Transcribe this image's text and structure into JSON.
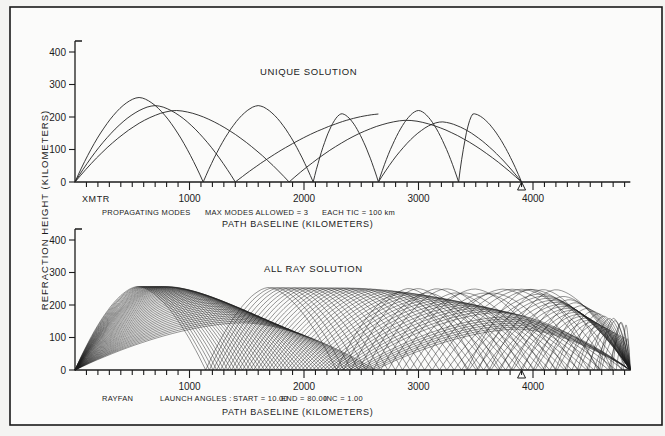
{
  "figure": {
    "y_axis_label": "REFRACTION  HEIGHT (KILOMETERS)",
    "x_axis_label": "PATH  BASELINE  (KILOMETERS)",
    "transmitter_label": "XMTR",
    "receiver_marker": "triangle",
    "receiver_x_km": 3900
  },
  "top_panel": {
    "title": "UNIQUE  SOLUTION",
    "note_left": "PROPAGATING MODES",
    "note_mid": "MAX  MODES  ALLOWED = 3",
    "note_right": "EACH  TIC = 100 km",
    "y_ticks": [
      "0",
      "100",
      "200",
      "300",
      "400"
    ],
    "x_ticks": [
      "1000",
      "2000",
      "3000",
      "4000"
    ]
  },
  "bottom_panel": {
    "title": "ALL  RAY  SOLUTION",
    "note_left": "RAYFAN",
    "note_mid": "LAUNCH  ANGLES :",
    "note_start": "START = 10.00",
    "note_end": "END = 80.00",
    "note_inc": "INC = 1.00",
    "y_ticks": [
      "0",
      "100",
      "200",
      "300",
      "400"
    ],
    "x_ticks": [
      "1000",
      "2000",
      "3000",
      "4000"
    ]
  },
  "chart_data": [
    {
      "type": "line",
      "title": "UNIQUE SOLUTION",
      "xlabel": "PATH BASELINE (KILOMETERS)",
      "ylabel": "REFRACTION HEIGHT (KILOMETERS)",
      "xlim": [
        0,
        4900
      ],
      "ylim": [
        0,
        480
      ],
      "grid": false,
      "annotations": [
        "XMTR",
        "PROPAGATING MODES",
        "MAX MODES ALLOWED = 3",
        "EACH TIC = 100 km"
      ],
      "series": [
        {
          "name": "Mode 1 (7 hops)",
          "hops": [
            [
              0,
              560,
              1120,
              260
            ],
            [
              1120,
              1600,
              2080,
              235
            ],
            [
              2080,
              2330,
              2650,
              210
            ],
            [
              2650,
              3000,
              3350,
              220
            ],
            [
              3350,
              3480,
              3900,
              210
            ]
          ]
        },
        {
          "name": "Mode 2 (3 hops)",
          "hops": [
            [
              0,
              700,
              1400,
              235
            ],
            [
              1400,
              2700,
              2650,
              210
            ],
            [
              2650,
              3200,
              3900,
              185
            ]
          ]
        },
        {
          "name": "Mode 3 (2 hops)",
          "hops": [
            [
              0,
              880,
              1870,
              220
            ],
            [
              1870,
              2900,
              3900,
              190
            ]
          ]
        }
      ],
      "hop_format": "[start_km, apex_km, end_km, apex_height_km]"
    },
    {
      "type": "line",
      "title": "ALL RAY SOLUTION",
      "xlabel": "PATH BASELINE (KILOMETERS)",
      "ylabel": "REFRACTION HEIGHT (KILOMETERS)",
      "xlim": [
        0,
        4900
      ],
      "ylim": [
        0,
        480
      ],
      "grid": false,
      "launch_angles": {
        "start": 10.0,
        "end": 80.0,
        "inc": 1.0
      },
      "annotations": [
        "RAYFAN",
        "LAUNCH ANGLES: START = 10.00 END = 80.00 INC = 1.00"
      ],
      "envelope_peaks_km": [
        [
          600,
          265
        ],
        [
          1400,
          235
        ],
        [
          2450,
          215
        ],
        [
          3350,
          205
        ],
        [
          4200,
          175
        ]
      ],
      "first_skip_km": 1120,
      "max_range_km": 4850
    }
  ]
}
